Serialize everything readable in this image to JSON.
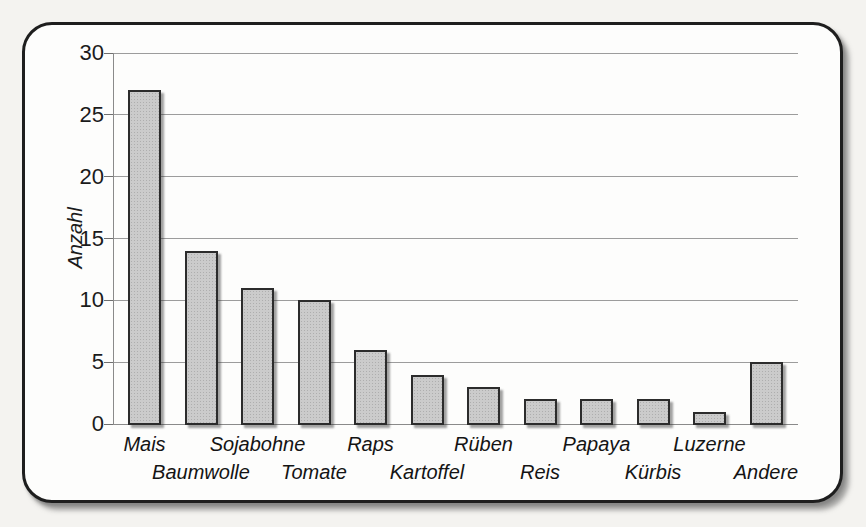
{
  "chart_data": {
    "type": "bar",
    "categories": [
      "Mais",
      "Baumwolle",
      "Sojabohne",
      "Tomate",
      "Raps",
      "Kartoffel",
      "Rüben",
      "Reis",
      "Papaya",
      "Kürbis",
      "Luzerne",
      "Andere"
    ],
    "values": [
      27,
      14,
      11,
      10,
      6,
      4,
      3,
      2,
      2,
      2,
      1,
      5
    ],
    "title": "",
    "xlabel": "",
    "ylabel": "Anzahl",
    "ylim": [
      0,
      30
    ],
    "yticks": [
      0,
      5,
      10,
      15,
      20,
      25,
      30
    ],
    "grid": true,
    "legend": false,
    "label_layout": "staggered-two-rows",
    "colors": {
      "bar_fill": "#cbcbcb",
      "bar_border": "#2c2c2c",
      "gridline": "#9c9c9c",
      "text": "#1b1b1b",
      "frame_border": "#1e1e1e",
      "frame_background": "#fdfdfc",
      "page_background": "#f4f3f0"
    }
  }
}
